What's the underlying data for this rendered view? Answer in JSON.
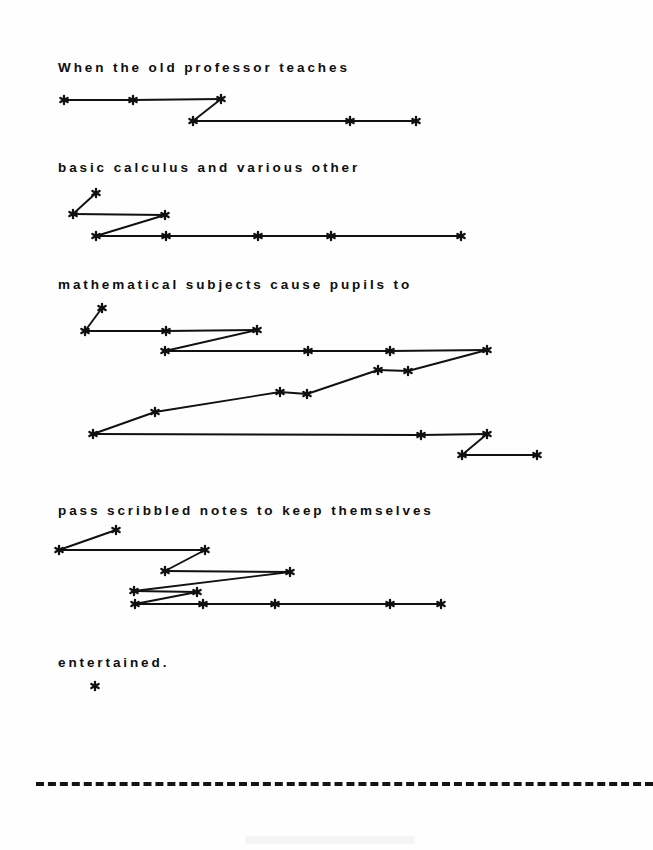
{
  "document": {
    "kind": "scanned-figure",
    "background_color": "#fefefe",
    "ink_color": "#111111",
    "width": 653,
    "height": 850
  },
  "sentence": {
    "full_text": "When the old professor teaches basic calculus and various other mathematical subjects cause pupils to pass scribbled notes to keep themselves entertained.",
    "lines": [
      {
        "id": "line-1",
        "text": "When the old professor teaches",
        "x": 58,
        "y": 60
      },
      {
        "id": "line-2",
        "text": "basic calculus and various other",
        "x": 58,
        "y": 160
      },
      {
        "id": "line-3",
        "text": "mathematical subjects cause pupils to",
        "x": 58,
        "y": 277
      },
      {
        "id": "line-4",
        "text": "pass scribbled notes to keep themselves",
        "x": 58,
        "y": 503
      },
      {
        "id": "line-5",
        "text": "entertained.",
        "x": 58,
        "y": 655
      }
    ]
  },
  "rule": {
    "id": "dashed-separator",
    "style": "dashed",
    "color": "#141414",
    "y": 782
  },
  "chart_data": {
    "type": "scatter",
    "title": "",
    "xlabel": "",
    "ylabel": "",
    "marker": "asterisk",
    "grid": false,
    "legend": null,
    "axis_visible": false,
    "xlim": [
      0,
      653
    ],
    "ylim": [
      850,
      0
    ],
    "note": "Each group is a contour of asterisk nodes joined by straight segments, drawn beneath its text line.",
    "groups": [
      {
        "name": "group-1",
        "under_line": "line-1",
        "points": [
          [
            64,
            100
          ],
          [
            133,
            100
          ],
          [
            221,
            99
          ],
          [
            193,
            121
          ],
          [
            350,
            121
          ],
          [
            416,
            121
          ]
        ],
        "segments": [
          [
            [
              64,
              100
            ],
            [
              133,
              100
            ]
          ],
          [
            [
              133,
              100
            ],
            [
              221,
              99
            ]
          ],
          [
            [
              221,
              99
            ],
            [
              193,
              121
            ]
          ],
          [
            [
              193,
              121
            ],
            [
              350,
              121
            ]
          ],
          [
            [
              350,
              121
            ],
            [
              416,
              121
            ]
          ]
        ]
      },
      {
        "name": "group-2",
        "under_line": "line-2",
        "points": [
          [
            96,
            193
          ],
          [
            73,
            214
          ],
          [
            165,
            215
          ],
          [
            96,
            236
          ],
          [
            166,
            236
          ],
          [
            258,
            236
          ],
          [
            331,
            236
          ],
          [
            461,
            236
          ]
        ],
        "segments": [
          [
            [
              96,
              193
            ],
            [
              73,
              214
            ]
          ],
          [
            [
              73,
              214
            ],
            [
              165,
              215
            ]
          ],
          [
            [
              165,
              215
            ],
            [
              96,
              236
            ]
          ],
          [
            [
              96,
              236
            ],
            [
              166,
              236
            ]
          ],
          [
            [
              166,
              236
            ],
            [
              258,
              236
            ]
          ],
          [
            [
              258,
              236
            ],
            [
              331,
              236
            ]
          ],
          [
            [
              331,
              236
            ],
            [
              461,
              236
            ]
          ]
        ]
      },
      {
        "name": "group-3",
        "under_line": "line-3",
        "points": [
          [
            102,
            308
          ],
          [
            85,
            331
          ],
          [
            166,
            331
          ],
          [
            257,
            330
          ],
          [
            165,
            351
          ],
          [
            308,
            351
          ],
          [
            390,
            351
          ],
          [
            487,
            350
          ],
          [
            378,
            370
          ],
          [
            408,
            371
          ],
          [
            280,
            392
          ],
          [
            307,
            394
          ],
          [
            155,
            412
          ],
          [
            93,
            434
          ],
          [
            421,
            435
          ],
          [
            487,
            434
          ],
          [
            462,
            455
          ],
          [
            537,
            455
          ]
        ],
        "segments": [
          [
            [
              102,
              308
            ],
            [
              85,
              331
            ]
          ],
          [
            [
              85,
              331
            ],
            [
              166,
              331
            ]
          ],
          [
            [
              166,
              331
            ],
            [
              257,
              330
            ]
          ],
          [
            [
              257,
              330
            ],
            [
              165,
              351
            ]
          ],
          [
            [
              165,
              351
            ],
            [
              308,
              351
            ]
          ],
          [
            [
              308,
              351
            ],
            [
              390,
              351
            ]
          ],
          [
            [
              390,
              351
            ],
            [
              487,
              350
            ]
          ],
          [
            [
              487,
              350
            ],
            [
              408,
              371
            ]
          ],
          [
            [
              408,
              371
            ],
            [
              378,
              370
            ]
          ],
          [
            [
              378,
              370
            ],
            [
              307,
              394
            ]
          ],
          [
            [
              307,
              394
            ],
            [
              280,
              392
            ]
          ],
          [
            [
              280,
              392
            ],
            [
              155,
              412
            ]
          ],
          [
            [
              155,
              412
            ],
            [
              93,
              434
            ]
          ],
          [
            [
              93,
              434
            ],
            [
              421,
              435
            ]
          ],
          [
            [
              421,
              435
            ],
            [
              487,
              434
            ]
          ],
          [
            [
              487,
              434
            ],
            [
              462,
              455
            ]
          ],
          [
            [
              462,
              455
            ],
            [
              537,
              455
            ]
          ]
        ]
      },
      {
        "name": "group-4",
        "under_line": "line-4",
        "points": [
          [
            116,
            530
          ],
          [
            59,
            550
          ],
          [
            205,
            550
          ],
          [
            165,
            571
          ],
          [
            290,
            572
          ],
          [
            134,
            591
          ],
          [
            197,
            592
          ],
          [
            135,
            604
          ],
          [
            203,
            604
          ],
          [
            275,
            604
          ],
          [
            390,
            604
          ],
          [
            441,
            604
          ]
        ],
        "segments": [
          [
            [
              116,
              530
            ],
            [
              59,
              550
            ]
          ],
          [
            [
              59,
              550
            ],
            [
              205,
              550
            ]
          ],
          [
            [
              205,
              550
            ],
            [
              165,
              571
            ]
          ],
          [
            [
              165,
              571
            ],
            [
              290,
              572
            ]
          ],
          [
            [
              290,
              572
            ],
            [
              134,
              591
            ]
          ],
          [
            [
              134,
              591
            ],
            [
              197,
              592
            ]
          ],
          [
            [
              197,
              592
            ],
            [
              135,
              604
            ]
          ],
          [
            [
              135,
              604
            ],
            [
              203,
              604
            ]
          ],
          [
            [
              203,
              604
            ],
            [
              275,
              604
            ]
          ],
          [
            [
              275,
              604
            ],
            [
              390,
              604
            ]
          ],
          [
            [
              390,
              604
            ],
            [
              441,
              604
            ]
          ]
        ]
      },
      {
        "name": "group-5",
        "under_line": "line-5",
        "points": [
          [
            95,
            686
          ]
        ],
        "segments": []
      }
    ]
  }
}
